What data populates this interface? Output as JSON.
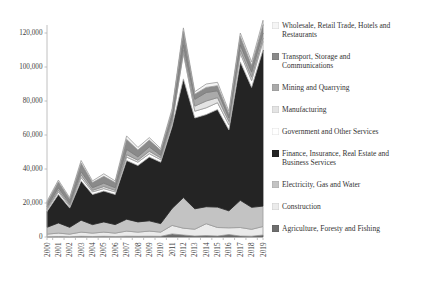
{
  "chart_data": {
    "type": "area",
    "stacked": true,
    "title": "",
    "xlabel": "",
    "ylabel": "",
    "grid": false,
    "legend_position": "right",
    "background_color": "#ffffff",
    "axis_color": "#b0b0b0",
    "tick_label_color": "#404040",
    "ylim": [
      0,
      120000
    ],
    "yticks": [
      0,
      20000,
      40000,
      60000,
      80000,
      100000,
      120000
    ],
    "ytick_labels": [
      "0",
      "20,000",
      "40,000",
      "60,000",
      "80,000",
      "100,000",
      "120,000"
    ],
    "categories": [
      "2000",
      "2001",
      "2002",
      "2003",
      "2004",
      "2005",
      "2006",
      "2007",
      "2008",
      "2009",
      "2010",
      "2011",
      "2012",
      "2013",
      "2014",
      "2015",
      "2016",
      "2017",
      "2018",
      "2019"
    ],
    "series": [
      {
        "name": "Agriculture, Foresty and Fishing",
        "color": "#6e6e6e",
        "stroke": "#5a5a5a",
        "values": [
          200,
          300,
          200,
          400,
          300,
          400,
          300,
          500,
          400,
          500,
          400,
          1800,
          1200,
          600,
          800,
          600,
          1400,
          600,
          500,
          1200
        ]
      },
      {
        "name": "Construction",
        "color": "#ebebeb",
        "stroke": "#9b9b9b",
        "values": [
          1500,
          2000,
          1500,
          2500,
          2000,
          2500,
          2000,
          3000,
          2500,
          3000,
          2500,
          5000,
          4000,
          4000,
          7000,
          5000,
          4000,
          5000,
          4000,
          5000
        ]
      },
      {
        "name": "Electricity, Gas and Water",
        "color": "#c3c3c3",
        "stroke": "#9b9b9b",
        "values": [
          4000,
          6000,
          4000,
          7000,
          5000,
          6000,
          5000,
          7000,
          6000,
          6000,
          5000,
          10000,
          18000,
          12000,
          10000,
          12000,
          10000,
          16000,
          13000,
          12000
        ]
      },
      {
        "name": "Finance, Insurance, Real Estate and Business Services",
        "color": "#242424",
        "stroke": "#242424",
        "values": [
          9300,
          16700,
          11300,
          23100,
          17700,
          18100,
          17700,
          34500,
          33100,
          37500,
          36100,
          48200,
          69800,
          53400,
          54200,
          57400,
          47600,
          81400,
          70500,
          91800
        ]
      },
      {
        "name": "Government and Other Services",
        "color": "#ffffff",
        "stroke": "#aaaaaa",
        "values": [
          1000,
          1500,
          1000,
          2000,
          1500,
          1500,
          1500,
          2000,
          2000,
          2000,
          1500,
          2000,
          15000,
          4000,
          4000,
          4000,
          3000,
          5000,
          4000,
          5000
        ]
      },
      {
        "name": "Manufacturing",
        "color": "#e4e4e4",
        "stroke": "#9b9b9b",
        "values": [
          800,
          1000,
          800,
          1500,
          1000,
          1200,
          1000,
          1500,
          1200,
          1500,
          1000,
          1500,
          2000,
          3000,
          4000,
          3000,
          2000,
          2000,
          2000,
          2000
        ]
      },
      {
        "name": "Mining and Quarrying",
        "color": "#aaaaaa",
        "stroke": "#8c8c8c",
        "values": [
          1000,
          1500,
          1000,
          2000,
          1500,
          2000,
          1500,
          3000,
          2000,
          2500,
          1500,
          2000,
          3000,
          4000,
          5000,
          4000,
          2000,
          3000,
          3000,
          3000
        ]
      },
      {
        "name": "Transport, Storage and Communications",
        "color": "#8a8a8a",
        "stroke": "#7b7b7b",
        "values": [
          2500,
          3500,
          2500,
          5000,
          3000,
          4000,
          3000,
          6000,
          4000,
          4000,
          3000,
          3500,
          8000,
          3000,
          3000,
          3000,
          2500,
          5000,
          4000,
          5000
        ]
      },
      {
        "name": "Wholesale, Retail Trade, Hotels and Restaurants",
        "color": "#f5f5f5",
        "stroke": "#9b9b9b",
        "values": [
          800,
          1000,
          800,
          1500,
          1000,
          1500,
          1000,
          2000,
          1500,
          1500,
          1000,
          1500,
          2000,
          1500,
          2000,
          2000,
          1500,
          2000,
          2000,
          2500
        ]
      }
    ],
    "legend": [
      {
        "label": "Wholesale, Retail Trade, Hotels and Restaurants",
        "color": "#f5f5f5"
      },
      {
        "label": "Transport, Storage and Communications",
        "color": "#8a8a8a"
      },
      {
        "label": "Mining and Quarrying",
        "color": "#aaaaaa"
      },
      {
        "label": "Manufacturing",
        "color": "#e4e4e4"
      },
      {
        "label": "Government and Other Services",
        "color": "#ffffff"
      },
      {
        "label": "Finance, Insurance, Real Estate and Business Services",
        "color": "#242424"
      },
      {
        "label": "Electricity, Gas and Water",
        "color": "#c3c3c3"
      },
      {
        "label": "Construction",
        "color": "#ebebeb"
      },
      {
        "label": "Agriculture, Foresty and Fishing",
        "color": "#6e6e6e"
      }
    ]
  }
}
